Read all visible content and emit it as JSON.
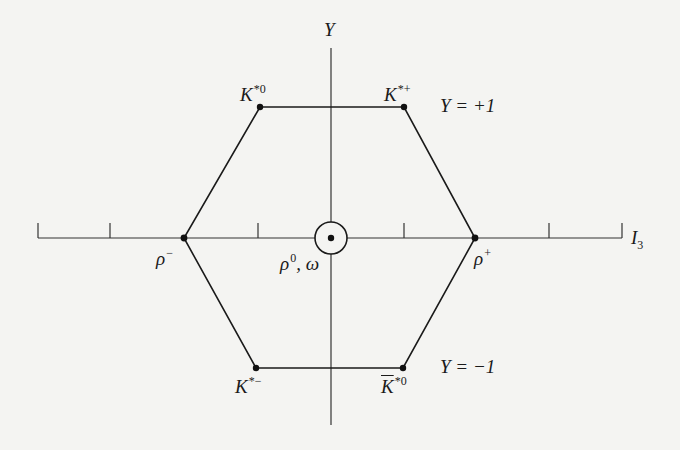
{
  "diagram": {
    "axes": {
      "y_label": "Y",
      "x_label": "I",
      "x_label_sub": "3"
    },
    "rows": {
      "top": "Y = +1",
      "bottom": "Y = −1"
    },
    "particles": {
      "k_star_0": {
        "base": "K",
        "sup": "*0",
        "I3": -0.5,
        "Y": 1
      },
      "k_star_plus": {
        "base": "K",
        "sup": "*+",
        "I3": 0.5,
        "Y": 1
      },
      "rho_minus": {
        "base": "ρ",
        "sup": "−",
        "I3": -1,
        "Y": 0
      },
      "rho_plus": {
        "base": "ρ",
        "sup": "+",
        "I3": 1,
        "Y": 0
      },
      "rho0_omega": {
        "base": "ρ",
        "sup": "0",
        "suffix": ", ω",
        "I3": 0,
        "Y": 0
      },
      "k_star_minus": {
        "base": "K",
        "sup": "*−",
        "I3": -0.5,
        "Y": -1
      },
      "k_bar_star_0": {
        "base": "K",
        "sup": "*0",
        "I3": 0.5,
        "Y": -1
      }
    },
    "colors": {
      "ink": "#1a1a1a",
      "paper": "#f4f4f2"
    }
  }
}
